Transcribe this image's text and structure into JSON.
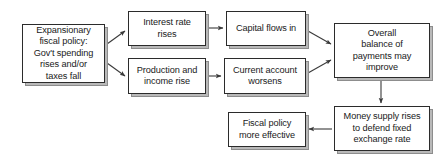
{
  "diagram": {
    "type": "flowchart",
    "background_color": "#ffffff",
    "box_border_color": "#2b2b2b",
    "box_fill_color": "#ffffff",
    "box_shadow_color": "#8d8d8d",
    "arrow_color": "#3a3a3a",
    "nodes": [
      {
        "id": "expansionary-fiscal-policy",
        "label": "Expansionary\nfiscal policy:\nGov't spending\nrises and/or\ntaxes fall",
        "x": 22,
        "y": 24,
        "width": 83,
        "height": 59
      },
      {
        "id": "interest-rate-rises",
        "label": "Interest rate\nrises",
        "x": 128,
        "y": 11,
        "width": 78,
        "height": 35
      },
      {
        "id": "production-and-income-rise",
        "label": "Production and\nincome rise",
        "x": 128,
        "y": 58,
        "width": 78,
        "height": 36
      },
      {
        "id": "capital-flows-in",
        "label": "Capital flows in",
        "x": 226,
        "y": 11,
        "width": 80,
        "height": 35
      },
      {
        "id": "current-account-worsens",
        "label": "Current account\nworsens",
        "x": 224,
        "y": 58,
        "width": 82,
        "height": 36
      },
      {
        "id": "overall-balance-of-payments",
        "label": "Overall\nbalance of\npayments may\nimprove",
        "x": 334,
        "y": 23,
        "width": 96,
        "height": 55
      },
      {
        "id": "money-supply-rises",
        "label": "Money supply rises\nto defend fixed\nexchange rate",
        "x": 334,
        "y": 106,
        "width": 96,
        "height": 45
      },
      {
        "id": "fiscal-policy-more-effective",
        "label": "Fiscal policy\nmore effective",
        "x": 228,
        "y": 112,
        "width": 78,
        "height": 35
      }
    ],
    "edges": [
      {
        "id": "policy-to-interest-rate",
        "from": "expansionary-fiscal-policy",
        "to": "interest-rate-rises",
        "style": "diagonal-up"
      },
      {
        "id": "policy-to-production",
        "from": "expansionary-fiscal-policy",
        "to": "production-and-income-rise",
        "style": "diagonal-down"
      },
      {
        "id": "interest-rate-to-capital-flows",
        "from": "interest-rate-rises",
        "to": "capital-flows-in",
        "style": "horizontal"
      },
      {
        "id": "production-to-current-account",
        "from": "production-and-income-rise",
        "to": "current-account-worsens",
        "style": "horizontal"
      },
      {
        "id": "capital-flows-to-balance",
        "from": "capital-flows-in",
        "to": "overall-balance-of-payments",
        "style": "diagonal-down"
      },
      {
        "id": "current-account-to-balance",
        "from": "current-account-worsens",
        "to": "overall-balance-of-payments",
        "style": "diagonal-up"
      },
      {
        "id": "balance-to-money-supply",
        "from": "overall-balance-of-payments",
        "to": "money-supply-rises",
        "style": "vertical-down"
      },
      {
        "id": "money-supply-to-fiscal-policy",
        "from": "money-supply-rises",
        "to": "fiscal-policy-more-effective",
        "style": "horizontal-left"
      }
    ]
  }
}
